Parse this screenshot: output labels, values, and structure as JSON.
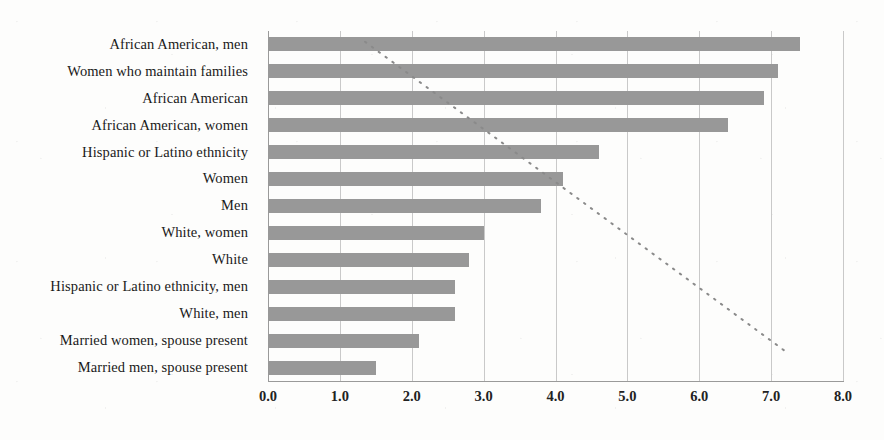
{
  "chart_data": {
    "type": "bar",
    "orientation": "horizontal",
    "title": "",
    "subtitle": "",
    "xlabel": "",
    "ylabel": "",
    "xlim": [
      0.0,
      8.0
    ],
    "xticks": [
      "0.0",
      "1.0",
      "2.0",
      "3.0",
      "4.0",
      "5.0",
      "6.0",
      "7.0",
      "8.0"
    ],
    "xtick_values": [
      0,
      1,
      2,
      3,
      4,
      5,
      6,
      7,
      8
    ],
    "grid": "vertical",
    "legend": "none",
    "bar_color": "#989898",
    "gridline_color": "#c9c9c9",
    "axis_color": "#9a9a9a",
    "categories": [
      "African American, men",
      "Women who maintain families",
      "African American",
      "African American, women",
      "Hispanic or Latino ethnicity",
      "Women",
      "Men",
      "White, women",
      "White",
      "Hispanic or Latino ethnicity, men",
      "White, men",
      "Married women, spouse present",
      "Married men, spouse present"
    ],
    "values": [
      7.4,
      7.1,
      6.9,
      6.4,
      4.6,
      4.1,
      3.8,
      3.0,
      2.8,
      2.6,
      2.6,
      2.1,
      1.5
    ],
    "annotations": [
      {
        "name": "diagonal-dotted-trend-line",
        "style": "dotted",
        "color": "#8a8a8a",
        "from": [
          1.35,
          12.1
        ],
        "to": [
          7.2,
          0.6
        ]
      }
    ]
  }
}
